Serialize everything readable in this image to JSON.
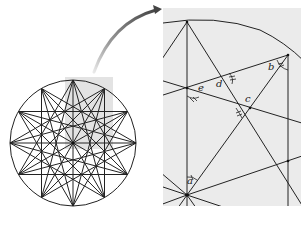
{
  "figure": {
    "colors": {
      "line": "#222222",
      "highlight": "#e3e3e3",
      "panel_bg": "#ebebeb",
      "arrow_dark": "#555555",
      "arrow_light": "#dddddd"
    },
    "left_figure": {
      "center": [
        73,
        143
      ],
      "radius": 63,
      "points": 12,
      "highlight_rect": {
        "x": 65,
        "y": 77,
        "w": 48,
        "h": 72
      }
    },
    "arrow": {
      "from": [
        95,
        72
      ],
      "to": [
        161,
        9
      ]
    },
    "inset": {
      "x": 163,
      "y": 8,
      "w": 138,
      "h": 198,
      "angle_labels": [
        {
          "id": "a",
          "text": "a"
        },
        {
          "id": "b",
          "text": "b"
        },
        {
          "id": "c",
          "text": "c"
        },
        {
          "id": "d",
          "text": "d"
        },
        {
          "id": "e",
          "text": "e"
        }
      ]
    }
  }
}
